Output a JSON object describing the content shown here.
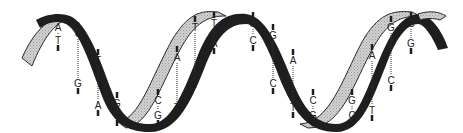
{
  "diagram": {
    "colors": {
      "dark_strand": "#1e1e1e",
      "light_strand": "#c9c9c9",
      "light_strand_outline": "#2a2a2a",
      "hbond": "#333333",
      "background": "#ffffff"
    },
    "base_pairs": [
      {
        "x": 58,
        "top": "A",
        "bottom": "T",
        "y1": 22,
        "y2": 45
      },
      {
        "x": 78,
        "top": "C",
        "bottom": "G",
        "y1": 28,
        "y2": 88
      },
      {
        "x": 98,
        "top": "T",
        "bottom": "A",
        "y1": 55,
        "y2": 110
      },
      {
        "x": 117,
        "top": "G",
        "bottom": "C",
        "y1": 98,
        "y2": 120
      },
      {
        "x": 158,
        "top": "C",
        "bottom": "G",
        "y1": 95,
        "y2": 120
      },
      {
        "x": 177,
        "top": "A",
        "bottom": "T",
        "y1": 52,
        "y2": 112
      },
      {
        "x": 195,
        "top": "T",
        "bottom": "A",
        "y1": 22,
        "y2": 82
      },
      {
        "x": 214,
        "top": "T",
        "bottom": "A",
        "y1": 18,
        "y2": 48
      },
      {
        "x": 253,
        "top": "G",
        "bottom": "C",
        "y1": 18,
        "y2": 45
      },
      {
        "x": 273,
        "top": "G",
        "bottom": "C",
        "y1": 30,
        "y2": 88
      },
      {
        "x": 293,
        "top": "A",
        "bottom": "T",
        "y1": 55,
        "y2": 112
      },
      {
        "x": 313,
        "top": "C",
        "bottom": "G",
        "y1": 95,
        "y2": 120
      },
      {
        "x": 352,
        "top": "G",
        "bottom": "C",
        "y1": 95,
        "y2": 120
      },
      {
        "x": 372,
        "top": "A",
        "bottom": "T",
        "y1": 50,
        "y2": 115
      },
      {
        "x": 391,
        "top": "G",
        "bottom": "C",
        "y1": 22,
        "y2": 85
      },
      {
        "x": 411,
        "top": "C",
        "bottom": "G",
        "y1": 18,
        "y2": 48
      }
    ]
  }
}
